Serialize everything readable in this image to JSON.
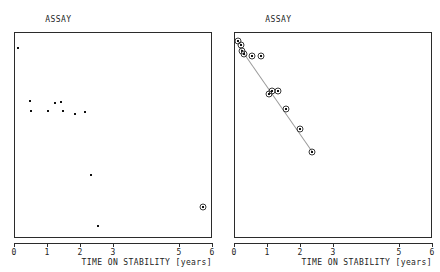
{
  "figure": {
    "axis_caption": "TIME ON STABILITY [years]",
    "tick_labels": [
      "0",
      "1",
      "2",
      "3",
      "5",
      "6"
    ],
    "tick_values": [
      0,
      1,
      2,
      3,
      5,
      6
    ]
  },
  "panels": [
    {
      "id": "technician-a",
      "title_line1": "ASSAY",
      "title_line2": "(technician A)"
    },
    {
      "id": "technician-b",
      "title_line1": "ASSAY",
      "title_line2": "(technician B)"
    }
  ],
  "chart_data": [
    {
      "type": "scatter",
      "title": "ASSAY (technician A)",
      "xlabel": "TIME ON STABILITY [years]",
      "ylabel": "",
      "xlim": [
        0,
        6
      ],
      "ylim": [
        0,
        100
      ],
      "grid": false,
      "legend": "none",
      "xticks": [
        0,
        1,
        2,
        3,
        5,
        6
      ],
      "xticklabels": [
        "0",
        "1",
        "2",
        "3",
        "5",
        "6"
      ],
      "series": [
        {
          "name": "assay values",
          "points": [
            {
              "x": 0.09,
              "y": 92.5,
              "outlier": false
            },
            {
              "x": 0.46,
              "y": 67.0,
              "outlier": false
            },
            {
              "x": 0.48,
              "y": 62.0,
              "outlier": false
            },
            {
              "x": 0.99,
              "y": 62.0,
              "outlier": false
            },
            {
              "x": 1.22,
              "y": 66.0,
              "outlier": false
            },
            {
              "x": 1.39,
              "y": 66.5,
              "outlier": false
            },
            {
              "x": 1.44,
              "y": 62.0,
              "outlier": false
            },
            {
              "x": 1.81,
              "y": 60.5,
              "outlier": false
            },
            {
              "x": 2.12,
              "y": 61.5,
              "outlier": false
            },
            {
              "x": 2.3,
              "y": 31.0,
              "outlier": false
            },
            {
              "x": 2.5,
              "y": 6.5,
              "outlier": false
            },
            {
              "x": 5.7,
              "y": 15.5,
              "outlier": true
            }
          ]
        }
      ],
      "annotations": [
        "circled marker denotes flagged outlier"
      ]
    },
    {
      "type": "scatter",
      "title": "ASSAY (technician B)",
      "xlabel": "TIME ON STABILITY [years]",
      "ylabel": "",
      "xlim": [
        0,
        6
      ],
      "ylim": [
        0,
        100
      ],
      "grid": false,
      "legend": "none",
      "xticks": [
        0,
        1,
        2,
        3,
        5,
        6
      ],
      "xticklabels": [
        "0",
        "1",
        "2",
        "3",
        "5",
        "6"
      ],
      "series": [
        {
          "name": "assay values",
          "points": [
            {
              "x": 0.1,
              "y": 96.0,
              "outlier": true
            },
            {
              "x": 0.17,
              "y": 94.0,
              "outlier": true
            },
            {
              "x": 0.22,
              "y": 91.5,
              "outlier": true
            },
            {
              "x": 0.27,
              "y": 90.0,
              "outlier": true
            },
            {
              "x": 0.52,
              "y": 89.0,
              "outlier": true
            },
            {
              "x": 0.78,
              "y": 89.0,
              "outlier": true
            },
            {
              "x": 1.03,
              "y": 70.5,
              "outlier": true
            },
            {
              "x": 1.13,
              "y": 72.0,
              "outlier": true
            },
            {
              "x": 1.3,
              "y": 72.0,
              "outlier": true
            },
            {
              "x": 1.54,
              "y": 63.0,
              "outlier": true
            },
            {
              "x": 1.98,
              "y": 53.5,
              "outlier": true
            },
            {
              "x": 2.33,
              "y": 42.0,
              "outlier": true
            }
          ]
        }
      ],
      "trendline": {
        "x0": 0.14,
        "y0": 93.0,
        "x1": 2.33,
        "y1": 42.5
      },
      "annotations": [
        "regression line fitted through all points"
      ]
    }
  ]
}
